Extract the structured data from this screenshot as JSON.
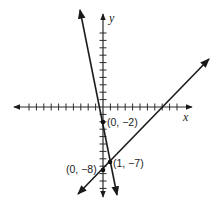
{
  "chart_data": {
    "type": "line",
    "title": "",
    "xlabel": "x",
    "ylabel": "y",
    "xlim": [
      -10,
      10
    ],
    "ylim": [
      -11,
      10
    ],
    "grid": false,
    "legend": null,
    "axes": {
      "x_ticks_unit": 1,
      "y_ticks_unit": 1,
      "tick_labels_shown": false
    },
    "series": [
      {
        "name": "steep line",
        "equation": "y = -5x - 2",
        "slope": -5,
        "intercept": -2,
        "points": [
          {
            "x": 0,
            "y": -2
          },
          {
            "x": 1,
            "y": -7
          }
        ]
      },
      {
        "name": "shallow line",
        "equation": "y = x - 8",
        "slope": 1,
        "intercept": -8,
        "points": [
          {
            "x": 0,
            "y": -8
          },
          {
            "x": 1,
            "y": -7
          }
        ]
      }
    ],
    "annotations": [
      {
        "text": "(0, −2)",
        "x": 0,
        "y": -2
      },
      {
        "text": "(0, −8)",
        "x": 0,
        "y": -8
      },
      {
        "text": "(1, −7)",
        "x": 1,
        "y": -7
      }
    ]
  },
  "labels": {
    "x_axis": "x",
    "y_axis": "y",
    "point_a": "(0, −2)",
    "point_b": "(0, −8)",
    "point_c": "(1, −7)"
  }
}
